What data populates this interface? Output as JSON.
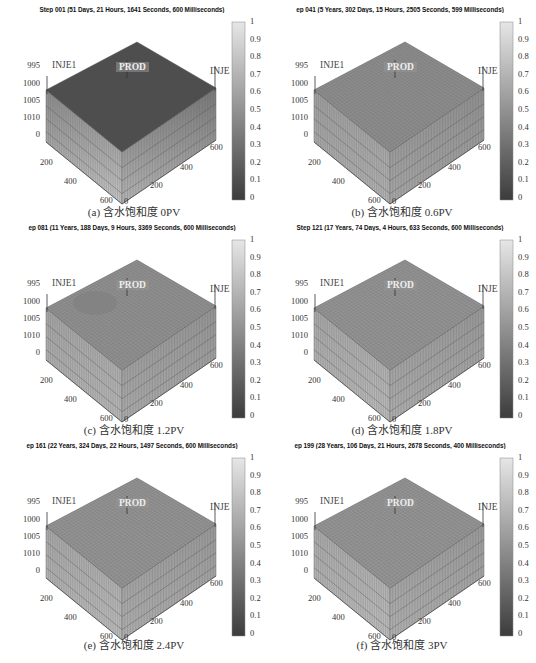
{
  "figure": {
    "footer_caption": ""
  },
  "chart_data": [
    {
      "type": "heatmap",
      "panel": "a",
      "title": "Step 001 (51 Days, 21 Hours, 1641 Seconds, 600 Milliseconds)",
      "caption": "(a) 含水饱和度 0PV",
      "z_ticks": [
        "995",
        "1000",
        "1005",
        "1010",
        "0"
      ],
      "x_ticks": [
        "200",
        "400",
        "600"
      ],
      "y_ticks": [
        "0",
        "200",
        "400",
        "600"
      ],
      "colorbar_ticks": [
        "1",
        "0.9",
        "0.8",
        "0.7",
        "0.6",
        "0.5",
        "0.4",
        "0.3",
        "0.2",
        "0.1",
        "0"
      ],
      "colorbar_range": [
        0,
        1
      ],
      "wells": [
        "INJE1",
        "PROD",
        "INJE"
      ],
      "top_color": "#4e4e4e",
      "left_top_color": "#8a8a8a",
      "left_bottom_color": "#c4c4c4",
      "right_top_color": "#777777",
      "right_bottom_color": "#b4b4b4",
      "description": "Initial water saturation, top layer dark (~0.1-0.2), lower layers lighter"
    },
    {
      "type": "heatmap",
      "panel": "b",
      "title": "ep 041 (5 Years, 302 Days, 15 Hours, 2505 Seconds, 599 Milliseconds)",
      "caption": "(b) 含水饱和度 0.6PV",
      "z_ticks": [
        "995",
        "1000",
        "1005",
        "1010",
        "0"
      ],
      "x_ticks": [
        "200",
        "400",
        "600"
      ],
      "y_ticks": [
        "0",
        "200",
        "400",
        "600"
      ],
      "colorbar_ticks": [
        "1",
        "0.9",
        "0.8",
        "0.7",
        "0.6",
        "0.5",
        "0.4",
        "0.3",
        "0.2",
        "0.1",
        "0"
      ],
      "colorbar_range": [
        0,
        1
      ],
      "wells": [
        "INJE1",
        "PROD",
        "INJE"
      ],
      "top_color": "#8c8c8c",
      "left_top_color": "#9d9d9d",
      "left_bottom_color": "#b2b2b2",
      "right_top_color": "#8e8e8e",
      "right_bottom_color": "#a6a6a6",
      "description": "Water saturation at 0.6 PV injected (~0.4-0.5)"
    },
    {
      "type": "heatmap",
      "panel": "c",
      "title": "ep 081 (11 Years, 188 Days, 9 Hours, 3369 Seconds, 600 Milliseconds)",
      "caption": "(c) 含水饱和度 1.2PV",
      "z_ticks": [
        "995",
        "1000",
        "1005",
        "1010",
        "0"
      ],
      "x_ticks": [
        "200",
        "400",
        "600"
      ],
      "y_ticks": [
        "0",
        "200",
        "400",
        "600"
      ],
      "colorbar_ticks": [
        "1",
        "0.9",
        "0.8",
        "0.7",
        "0.6",
        "0.5",
        "0.4",
        "0.3",
        "0.2",
        "0.1",
        "0"
      ],
      "colorbar_range": [
        0,
        1
      ],
      "wells": [
        "INJE1",
        "PROD",
        "INJE"
      ],
      "top_color": "#8f8f8f",
      "left_top_color": "#a3a3a3",
      "left_bottom_color": "#b8b8b8",
      "right_top_color": "#939393",
      "right_bottom_color": "#aaaaaa",
      "description": "Water saturation at 1.2 PV injected, darker channel near INJE1"
    },
    {
      "type": "heatmap",
      "panel": "d",
      "title": "Step 121 (17 Years, 74 Days, 4 Hours, 633 Seconds, 600 Milliseconds)",
      "caption": "(d) 含水饱和度 1.8PV",
      "z_ticks": [
        "995",
        "1000",
        "1005",
        "1010",
        "0"
      ],
      "x_ticks": [
        "200",
        "400",
        "600"
      ],
      "y_ticks": [
        "0",
        "200",
        "400",
        "600"
      ],
      "colorbar_ticks": [
        "1",
        "0.9",
        "0.8",
        "0.7",
        "0.6",
        "0.5",
        "0.4",
        "0.3",
        "0.2",
        "0.1",
        "0"
      ],
      "colorbar_range": [
        0,
        1
      ],
      "wells": [
        "INJE1",
        "PROD",
        "INJE"
      ],
      "top_color": "#939393",
      "left_top_color": "#a6a6a6",
      "left_bottom_color": "#bbbbbb",
      "right_top_color": "#969696",
      "right_bottom_color": "#adadad",
      "description": "Water saturation at 1.8 PV injected"
    },
    {
      "type": "heatmap",
      "panel": "e",
      "title": "ep 161 (22 Years, 324 Days, 22 Hours, 1497 Seconds, 600 Milliseconds)",
      "caption": "(e) 含水饱和度 2.4PV",
      "z_ticks": [
        "995",
        "1000",
        "1005",
        "1010",
        "0"
      ],
      "x_ticks": [
        "200",
        "400",
        "600"
      ],
      "y_ticks": [
        "0",
        "200",
        "400",
        "600"
      ],
      "colorbar_ticks": [
        "1",
        "0.9",
        "0.8",
        "0.7",
        "0.6",
        "0.5",
        "0.4",
        "0.3",
        "0.2",
        "0.1",
        "0"
      ],
      "colorbar_range": [
        0,
        1
      ],
      "wells": [
        "INJE1",
        "PROD",
        "INJE"
      ],
      "top_color": "#939393",
      "left_top_color": "#a6a6a6",
      "left_bottom_color": "#bcbcbc",
      "right_top_color": "#979797",
      "right_bottom_color": "#aeaeae",
      "description": "Water saturation at 2.4 PV injected"
    },
    {
      "type": "heatmap",
      "panel": "f",
      "title": "ep 199 (28 Years, 106 Days, 21 Hours, 2678 Seconds, 400 Milliseconds)",
      "caption": "(f) 含水饱和度 3PV",
      "z_ticks": [
        "995",
        "1000",
        "1005",
        "1010",
        "0"
      ],
      "x_ticks": [
        "200",
        "400",
        "600"
      ],
      "y_ticks": [
        "0",
        "200",
        "400",
        "600"
      ],
      "colorbar_ticks": [
        "1",
        "0.9",
        "0.8",
        "0.7",
        "0.6",
        "0.5",
        "0.4",
        "0.3",
        "0.2",
        "0.1",
        "0"
      ],
      "colorbar_range": [
        0,
        1
      ],
      "wells": [
        "INJE1",
        "PROD",
        "INJE"
      ],
      "top_color": "#949494",
      "left_top_color": "#a8a8a8",
      "left_bottom_color": "#bdbdbd",
      "right_top_color": "#989898",
      "right_bottom_color": "#afafaf",
      "description": "Water saturation at 3 PV injected"
    }
  ]
}
